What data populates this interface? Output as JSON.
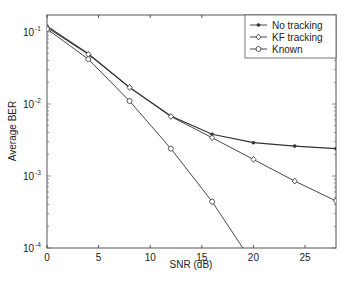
{
  "chart_data": {
    "type": "line",
    "title": "",
    "xlabel": "SNR (dB)",
    "ylabel": "Average BER",
    "xlim": [
      0,
      28
    ],
    "ylim": [
      0.0001,
      0.2
    ],
    "yscale": "log",
    "grid": false,
    "legend_position": "upper right",
    "xticks": [
      0,
      5,
      10,
      15,
      20,
      25
    ],
    "xtick_labels": [
      "0",
      "5",
      "10",
      "15",
      "20",
      "25"
    ],
    "yticks": [
      0.1,
      0.01,
      0.001,
      0.0001
    ],
    "ytick_labels": [
      {
        "base": "10",
        "exp": "-1"
      },
      {
        "base": "10",
        "exp": "-2"
      },
      {
        "base": "10",
        "exp": "-3"
      },
      {
        "base": "10",
        "exp": "-4"
      }
    ],
    "x": [
      0,
      4,
      8,
      12,
      16,
      20,
      24,
      28
    ],
    "series": [
      {
        "name": "No tracking",
        "marker": "star",
        "values": [
          0.12,
          0.05,
          0.017,
          0.0068,
          0.0038,
          0.0029,
          0.0026,
          0.0024
        ]
      },
      {
        "name": "KF tracking",
        "marker": "diamond",
        "values": [
          0.115,
          0.049,
          0.017,
          0.0067,
          0.0034,
          0.0017,
          0.00085,
          0.00045
        ]
      },
      {
        "name": "Known",
        "marker": "circle",
        "values": [
          0.11,
          0.042,
          0.011,
          0.0024,
          0.00044,
          6e-05,
          null,
          null
        ]
      }
    ]
  },
  "colors": {
    "line": "#333333",
    "axis": "#444444",
    "background": "#ffffff"
  }
}
